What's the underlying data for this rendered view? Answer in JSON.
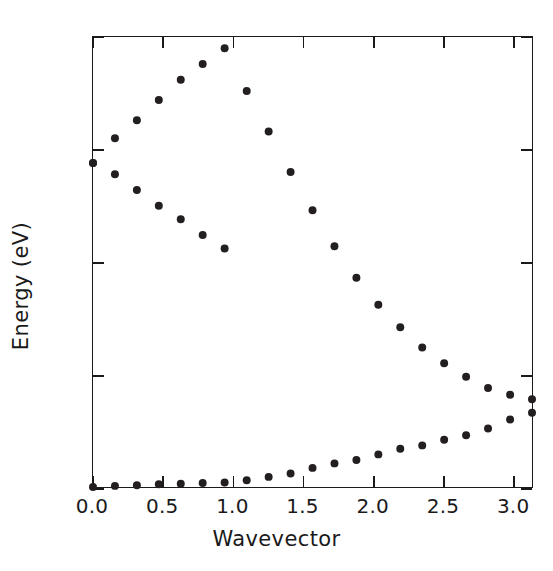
{
  "chart_data": {
    "type": "scatter",
    "title": "",
    "xlabel": "Wavevector",
    "ylabel": "Energy (eV)",
    "xlim": [
      0.0,
      3.1416
    ],
    "ylim": [
      0,
      20
    ],
    "xticks": [
      0.0,
      0.5,
      1.0,
      1.5,
      2.0,
      2.5,
      3.0
    ],
    "xticklabels": [
      "0.0",
      "0.5",
      "1.0",
      "1.5",
      "2.0",
      "2.5",
      "3.0"
    ],
    "yticks": [
      0,
      5,
      10,
      15,
      20
    ],
    "yticklabels": [
      "0",
      "5",
      "10",
      "15",
      "20"
    ],
    "grid": false,
    "legend": false,
    "marker": "filled-circle",
    "marker_color": "#231f20",
    "marker_size_px": 8,
    "series": [
      {
        "name": "upper-branch",
        "x": [
          0.0,
          0.157,
          0.314,
          0.471,
          0.628,
          0.785,
          0.942,
          1.1,
          1.257,
          1.414,
          1.571,
          1.728,
          1.885,
          2.042,
          2.199,
          2.356,
          2.513,
          2.67,
          2.827,
          2.985,
          3.1416
        ],
        "y": [
          14.4,
          15.5,
          16.3,
          17.2,
          18.1,
          18.8,
          19.5,
          17.6,
          15.8,
          14.0,
          12.3,
          10.7,
          9.3,
          8.1,
          7.1,
          6.2,
          5.5,
          4.9,
          4.4,
          4.1,
          3.9
        ]
      },
      {
        "name": "lower-branch",
        "x": [
          0.0,
          0.157,
          0.314,
          0.471,
          0.628,
          0.785,
          0.942,
          1.1,
          1.257,
          1.414,
          1.571,
          1.728,
          1.885,
          2.042,
          2.199,
          2.356,
          2.513,
          2.67,
          2.827,
          2.985,
          3.1416
        ],
        "y": [
          0.0,
          0.05,
          0.08,
          0.12,
          0.15,
          0.18,
          0.2,
          0.3,
          0.45,
          0.6,
          0.85,
          1.05,
          1.2,
          1.45,
          1.7,
          1.85,
          2.1,
          2.3,
          2.6,
          3.0,
          3.3
        ]
      },
      {
        "name": "optical-descent",
        "x": [
          0.0,
          0.157,
          0.314,
          0.471,
          0.628,
          0.785,
          0.942
        ],
        "y": [
          14.4,
          13.9,
          13.2,
          12.5,
          11.9,
          11.2,
          10.6
        ]
      }
    ]
  },
  "axis": {
    "x_axis_name": "wavevector-axis",
    "y_axis_name": "energy-axis"
  }
}
